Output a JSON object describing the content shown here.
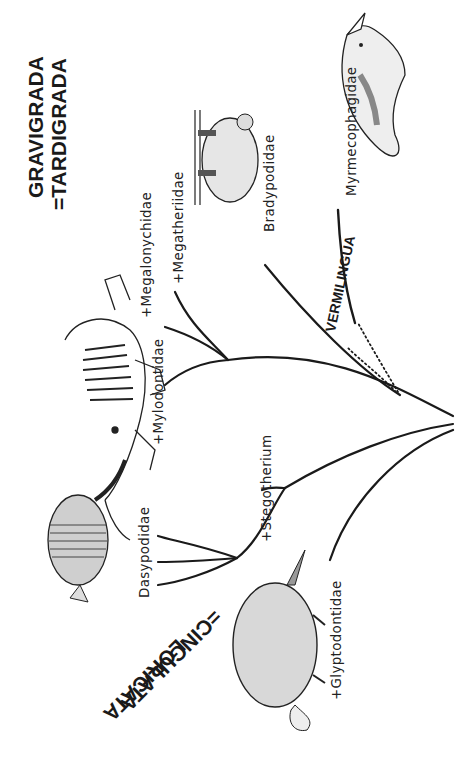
{
  "root": {
    "x": 455,
    "y": 420
  },
  "groups": {
    "tardigrada": {
      "line1": "GRAVIGRADA",
      "line2": "=TARDIGRADA"
    },
    "vermilingua": {
      "label": "VERMILINGUA"
    },
    "cingulata": {
      "line1": "LORICATA",
      "line2": "=CINGULATA"
    }
  },
  "taxa": [
    {
      "id": "myrmecophagidae",
      "label": "Myrmecophagidae",
      "extinct": false
    },
    {
      "id": "bradypodidae",
      "label": "Bradypodidae",
      "extinct": false
    },
    {
      "id": "megatheriidae",
      "label": "+Megatheriidae",
      "extinct": true
    },
    {
      "id": "megalonychidae",
      "label": "+Megalonychidae",
      "extinct": true
    },
    {
      "id": "mylodontidae",
      "label": "+Mylodontidae",
      "extinct": true
    },
    {
      "id": "dasypodidae",
      "label": "Dasypodidae",
      "extinct": false
    },
    {
      "id": "stegotherium",
      "label": "+Stegotherium",
      "extinct": true
    },
    {
      "id": "glyptodontidae",
      "label": "+Glyptodontidae",
      "extinct": true
    }
  ],
  "illustrations": [
    {
      "name": "anteater-illustration",
      "depicts": "anteater"
    },
    {
      "name": "tree-sloth-illustration",
      "depicts": "tree sloth"
    },
    {
      "name": "ground-sloth-skeleton-illustration",
      "depicts": "ground sloth skeleton"
    },
    {
      "name": "armadillo-illustration",
      "depicts": "armadillo"
    },
    {
      "name": "glyptodont-illustration",
      "depicts": "glyptodont"
    }
  ],
  "colors": {
    "line": "#1a1a1a",
    "background": "#ffffff"
  }
}
